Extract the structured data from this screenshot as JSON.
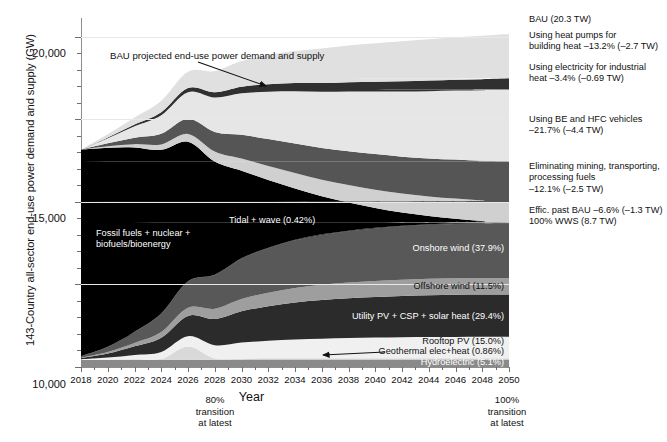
{
  "chart_data": {
    "type": "area",
    "title": "",
    "xlabel": "Year",
    "ylabel": "143-Country all-sector end-use power demand and supply (GW)",
    "xlim": [
      2018,
      2050
    ],
    "ylim": [
      0,
      21000
    ],
    "yticks": [
      "0",
      "5,000",
      "10,000",
      "15,000",
      "20,000"
    ],
    "ytick_values": [
      0,
      5000,
      10000,
      15000,
      20000
    ],
    "xticks": [
      "2018",
      "2020",
      "2022",
      "2024",
      "2026",
      "2028",
      "2030",
      "2032",
      "2034",
      "2036",
      "2038",
      "2040",
      "2042",
      "2044",
      "2046",
      "2048",
      "2050"
    ],
    "grid": "horizontal-light",
    "legend": "inline-annotations",
    "x": [
      2018,
      2020,
      2022,
      2024,
      2026,
      2028,
      2030,
      2032,
      2034,
      2036,
      2038,
      2040,
      2042,
      2044,
      2046,
      2048,
      2050
    ],
    "series": [
      {
        "name": "Hydroelectric",
        "label": "Hydroelectric (5.1%)",
        "share_pct": 5.1,
        "color": "#8a8a8a",
        "values": [
          420,
          430,
          437,
          442,
          444,
          445,
          446,
          447,
          448,
          448,
          448,
          448,
          448,
          448,
          448,
          448,
          448
        ]
      },
      {
        "name": "Geothermal elec+heat",
        "label": "Geothermal elec+heat (0.86%)",
        "share_pct": 0.86,
        "color": "#d9d9d9",
        "values": [
          14,
          22,
          32,
          42,
          800,
          76,
          75,
          75,
          75,
          75,
          75,
          75,
          75,
          75,
          75,
          75,
          75
        ]
      },
      {
        "name": "Rooftop PV",
        "label": "Rooftop PV (15.0%)",
        "share_pct": 15.0,
        "color": "#f0f0f0",
        "values": [
          35,
          120,
          260,
          430,
          620,
          800,
          960,
          1060,
          1140,
          1190,
          1230,
          1260,
          1280,
          1295,
          1300,
          1305,
          1305
        ]
      },
      {
        "name": "Utility PV + CSP + solar heat",
        "label": "Utility PV + CSP + solar heat (29.4%)",
        "share_pct": 29.4,
        "color": "#2b2b2b",
        "values": [
          70,
          240,
          520,
          860,
          1230,
          1580,
          1890,
          2090,
          2240,
          2340,
          2410,
          2460,
          2500,
          2530,
          2550,
          2555,
          2560
        ]
      },
      {
        "name": "Offshore wind",
        "label": "Offshore wind (11.5%)",
        "share_pct": 11.5,
        "color": "#9e9e9e",
        "values": [
          25,
          95,
          205,
          340,
          485,
          620,
          740,
          820,
          880,
          920,
          945,
          965,
          980,
          990,
          998,
          1000,
          1002
        ]
      },
      {
        "name": "Onshore wind",
        "label": "Onshore wind (37.9%)",
        "share_pct": 37.9,
        "color": "#585858",
        "values": [
          90,
          310,
          675,
          1115,
          1590,
          2040,
          2440,
          2700,
          2890,
          3020,
          3110,
          3180,
          3230,
          3265,
          3290,
          3300,
          3305
        ]
      },
      {
        "name": "Tidal + wave",
        "label": "Tidal + wave (0.42%)",
        "share_pct": 0.42,
        "color": "#111111",
        "values": [
          1,
          4,
          8,
          13,
          18,
          23,
          27,
          30,
          32,
          34,
          35,
          36,
          36,
          37,
          37,
          37,
          37
        ]
      },
      {
        "name": "Fossil fuels + nuclear + biofuels/bioenergy",
        "label": "Fossil fuels + nuclear +\nbiofuels/bioenergy",
        "color": "#000000",
        "values": [
          12500,
          12050,
          11150,
          9900,
          8450,
          6850,
          5300,
          4100,
          3100,
          2300,
          1700,
          1200,
          800,
          500,
          280,
          110,
          0
        ]
      },
      {
        "name": "Effic. past BAU",
        "label": "Effic. past BAU -6.6% (-1.3 TW)",
        "share_pct": -6.6,
        "tw": -1.3,
        "color": "#d0d0d0",
        "values": [
          0,
          90,
          200,
          330,
          470,
          610,
          740,
          840,
          930,
          1000,
          1060,
          1110,
          1150,
          1185,
          1215,
          1240,
          1260
        ]
      },
      {
        "name": "Eliminating mining, transporting, processing fuels",
        "label": "Eliminating mining, transporting,\nprocessing fuels\n-12.1% (-2.5 TW)",
        "share_pct": -12.1,
        "tw": -2.5,
        "color": "#555555",
        "values": [
          0,
          175,
          390,
          640,
          910,
          1180,
          1430,
          1630,
          1790,
          1930,
          2050,
          2150,
          2230,
          2300,
          2360,
          2410,
          2450
        ]
      },
      {
        "name": "Using BE and HFC vehicles",
        "label": "Using BE and HFC vehicles\n-21.7% (-4.4 TW)",
        "share_pct": -21.7,
        "tw": -4.4,
        "color": "#e6e6e6",
        "values": [
          0,
          310,
          690,
          1130,
          1610,
          2080,
          2520,
          2870,
          3160,
          3400,
          3610,
          3790,
          3940,
          4070,
          4180,
          4270,
          4350
        ]
      },
      {
        "name": "Using electricity for industrial heat",
        "label": "Using electricity for industrial\nheat -3.4% (-0.69 TW)",
        "share_pct": -3.4,
        "tw": -0.69,
        "color": "#303030",
        "values": [
          0,
          48,
          108,
          177,
          253,
          326,
          396,
          451,
          497,
          534,
          567,
          595,
          619,
          639,
          656,
          671,
          683
        ]
      },
      {
        "name": "Using heat pumps for building heat",
        "label": "Using heat pumps for\nbuilding heat -13.2% (-2.7 TW)",
        "share_pct": -13.2,
        "tw": -2.7,
        "color": "#e0e0e0",
        "values": [
          0,
          190,
          425,
          695,
          990,
          1280,
          1550,
          1765,
          1945,
          2090,
          2220,
          2330,
          2425,
          2500,
          2570,
          2625,
          2675
        ]
      }
    ],
    "totals": {
      "bau_label": "BAU (20.3 TW)",
      "bau_tw": 20.3,
      "bau_values": [
        13050,
        13450,
        13950,
        14450,
        15000,
        15550,
        16100,
        16650,
        17200,
        17750,
        18250,
        18750,
        19200,
        19600,
        19950,
        20150,
        20300
      ],
      "wws_label": "100% WWS (8.7 TW)",
      "wws_tw": 8.7,
      "wws_values": [
        13050,
        13200,
        13100,
        12750,
        12250,
        11650,
        11000,
        10550,
        10150,
        9800,
        9500,
        9250,
        9050,
        8950,
        8850,
        8780,
        8730
      ]
    },
    "annotations": {
      "bau_callout": "BAU projected end-use power demand and supply",
      "transition_80": "80%\ntransition\nat latest",
      "transition_80_year": 2030,
      "transition_100": "100%\ntransition\nat latest",
      "transition_100_year": 2050
    },
    "right_labels": [
      "BAU (20.3 TW)",
      "Using heat pumps for\nbuilding heat –13.2% (–2.7 TW)",
      "Using electricity for industrial\nheat –3.4% (–0.69 TW)",
      "Using BE and HFC vehicles\n–21.7% (–4.4 TW)",
      "Eliminating mining, transporting,\nprocessing fuels\n–12.1% (–2.5 TW)",
      "Effic. past BAU –6.6% (–1.3 TW)\n100% WWS (8.7 TW)"
    ],
    "inner_labels": [
      "Fossil fuels + nuclear +\nbiofuels/bioenergy",
      "Tidal + wave (0.42%)",
      "Onshore wind (37.9%)",
      "Offshore wind (11.5%)",
      "Utility PV + CSP + solar heat (29.4%)",
      "Rooftop PV (15.0%)",
      "Geothermal elec+heat (0.86%)",
      "Hydroelectric (5.1%)"
    ]
  }
}
